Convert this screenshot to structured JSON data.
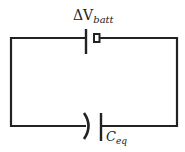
{
  "diagram": {
    "type": "circuit",
    "components": [
      {
        "id": "battery",
        "kind": "battery",
        "label_main": "ΔV",
        "label_sub": "batt",
        "position": "top-wire"
      },
      {
        "id": "capacitor",
        "kind": "capacitor",
        "label_main": "C",
        "label_sub": "eq",
        "position": "bottom-wire"
      }
    ],
    "connections": [
      [
        "battery",
        "capacitor"
      ],
      [
        "capacitor",
        "battery"
      ]
    ],
    "colors": {
      "wire": "#222222",
      "background": "#ffffff"
    }
  }
}
